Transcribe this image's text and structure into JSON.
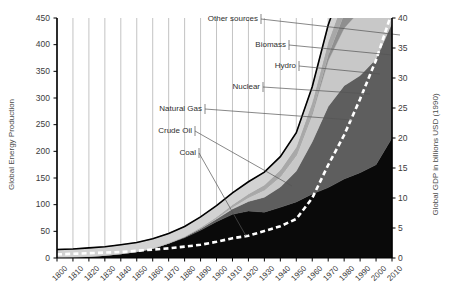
{
  "chart_data": {
    "type": "area",
    "title": "",
    "subtitle": "",
    "xlabel": "",
    "ylabel": "Global Energy Production",
    "y2label": "Global GDP in billions USD (1990)",
    "ylim": [
      0,
      450
    ],
    "y2lim": [
      0,
      40
    ],
    "grid": true,
    "legend_position": "inline-annotations",
    "x": [
      1800,
      1810,
      1820,
      1830,
      1840,
      1850,
      1860,
      1870,
      1880,
      1890,
      1900,
      1910,
      1920,
      1930,
      1940,
      1950,
      1960,
      1970,
      1980,
      1990,
      2000,
      2010
    ],
    "xtick_labels": [
      "1800",
      "1810",
      "1820",
      "1830",
      "1840",
      "1850",
      "1860",
      "1870",
      "1880",
      "1890",
      "1900",
      "1910",
      "1920",
      "1930",
      "1940",
      "1950",
      "1960",
      "1970",
      "1980",
      "1990",
      "2000",
      "2010"
    ],
    "ytick_labels": [
      "0",
      "50",
      "100",
      "150",
      "200",
      "250",
      "300",
      "350",
      "400",
      "450"
    ],
    "y2tick_labels": [
      "0",
      "5",
      "10",
      "15",
      "20",
      "25",
      "30",
      "35",
      "40"
    ],
    "stacking": "stacked-area",
    "series": [
      {
        "name": "Coal",
        "color": "#0a0a0a",
        "values": [
          1,
          2,
          3,
          5,
          8,
          12,
          18,
          27,
          38,
          52,
          68,
          82,
          88,
          86,
          95,
          105,
          120,
          132,
          148,
          160,
          175,
          225
        ]
      },
      {
        "name": "Crude Oil",
        "color": "#5e5e5e",
        "values": [
          0,
          0,
          0,
          0,
          0,
          0,
          0,
          1,
          2,
          3,
          5,
          10,
          18,
          28,
          38,
          58,
          98,
          152,
          175,
          182,
          198,
          215
        ]
      },
      {
        "name": "Natural Gas",
        "color": "#c8c8c8",
        "values": [
          0,
          0,
          0,
          0,
          0,
          0,
          0,
          0,
          0,
          1,
          2,
          4,
          8,
          14,
          20,
          30,
          52,
          86,
          108,
          122,
          140,
          158
        ]
      },
      {
        "name": "Nuclear",
        "color": "#8f8f8f",
        "values": [
          0,
          0,
          0,
          0,
          0,
          0,
          0,
          0,
          0,
          0,
          0,
          0,
          0,
          0,
          0,
          0,
          2,
          10,
          26,
          34,
          36,
          36
        ]
      },
      {
        "name": "Hydro",
        "color": "#a8a8a8",
        "values": [
          0,
          0,
          0,
          0,
          0,
          0,
          0,
          0,
          0,
          1,
          2,
          4,
          6,
          9,
          12,
          15,
          20,
          25,
          30,
          34,
          38,
          42
        ]
      },
      {
        "name": "Biomass",
        "color": "#d2d2d2",
        "values": [
          15,
          15,
          16,
          16,
          17,
          17,
          18,
          18,
          19,
          20,
          21,
          22,
          23,
          24,
          25,
          26,
          28,
          30,
          32,
          34,
          36,
          38
        ]
      },
      {
        "name": "Other sources",
        "color": "#9a9a9a",
        "values": [
          0,
          0,
          0,
          0,
          0,
          0,
          0,
          0,
          0,
          0,
          0,
          0,
          0,
          0,
          0,
          1,
          1,
          2,
          3,
          5,
          8,
          14
        ]
      }
    ],
    "gdp_line": {
      "name": "Global GDP in billions USD (1990)",
      "style": "white-dashed",
      "color": "#ffffff",
      "axis": "right",
      "values": [
        0.6,
        0.7,
        0.8,
        0.9,
        1.0,
        1.2,
        1.4,
        1.6,
        1.9,
        2.2,
        2.7,
        3.3,
        3.7,
        4.5,
        5.3,
        6.5,
        10.0,
        15.5,
        20.5,
        26.5,
        33.0,
        41.0
      ]
    },
    "total_line": {
      "name": "Total",
      "color": "#000000",
      "style": "solid"
    },
    "annotations": [
      {
        "label": "Other sources",
        "label_x": 258,
        "label_y": 14,
        "tip_x": 400,
        "tip_y": 35
      },
      {
        "label": "Biomass",
        "label_x": 286,
        "label_y": 40,
        "tip_x": 392,
        "tip_y": 55
      },
      {
        "label": "Hydro",
        "label_x": 296,
        "label_y": 61,
        "tip_x": 380,
        "tip_y": 74
      },
      {
        "label": "Nuclear",
        "label_x": 260,
        "label_y": 82,
        "tip_x": 370,
        "tip_y": 94
      },
      {
        "label": "Natural Gas",
        "label_x": 202,
        "label_y": 104,
        "tip_x": 352,
        "tip_y": 120
      },
      {
        "label": "Crude Oil",
        "label_x": 192,
        "label_y": 126,
        "tip_x": 292,
        "tip_y": 186
      },
      {
        "label": "Coal",
        "label_x": 196,
        "label_y": 148,
        "tip_x": 246,
        "tip_y": 236
      }
    ]
  }
}
